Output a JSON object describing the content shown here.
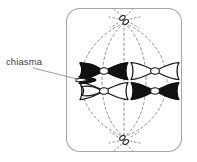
{
  "figure": {
    "kind": "biology-diagram",
    "title": "",
    "background_color": "#ffffff"
  },
  "annotations": [
    {
      "id": "chiasma",
      "label": "chiasma",
      "text_color": "#3d3d3d",
      "leader_line_color": "#8a8a8a",
      "text_x": 6,
      "text_y": 65,
      "leader_from_x": 33,
      "leader_from_y": 68,
      "leader_to_x": 79,
      "leader_to_y": 79
    }
  ],
  "cell": {
    "name": "cell-membrane",
    "shape": "rounded-rectangle",
    "x": 66,
    "y": 8,
    "width": 115,
    "height": 143,
    "corner_radius": 13,
    "stroke_color": "#a8a8a8",
    "stroke_width": 1.1,
    "fill": "none"
  },
  "poles": [
    {
      "name": "centrosome-top",
      "cx": 124,
      "cy": 20,
      "color": "#4a4a4a",
      "aster_ray_count": 6
    },
    {
      "name": "centrosome-bottom",
      "cx": 124,
      "cy": 140,
      "color": "#4a4a4a",
      "aster_ray_count": 6
    }
  ],
  "spindle": {
    "name": "spindle-fibers",
    "stroke_color": "#7d7d7d",
    "stroke_width": 0.8,
    "dash_pattern": "2.5,2.5",
    "fiber_count": 5,
    "top_pole_x": 124,
    "top_pole_y": 23,
    "bottom_pole_x": 124,
    "bottom_pole_y": 137,
    "equator_y": 81,
    "equator_x_positions": [
      80,
      102,
      124,
      146,
      167
    ]
  },
  "metaphase_plate": {
    "name": "metaphase-plate",
    "y": 81,
    "description": "two bivalents aligned at the cell equator"
  },
  "bivalents": [
    {
      "name": "bivalent-left",
      "has_chiasma": true,
      "chiasma_x": 80,
      "chiasma_y": 79,
      "chromosomes": [
        {
          "name": "chromosome-left-upper",
          "shade": "black",
          "fill": "#111111",
          "stroke": "#111111",
          "center_x": 104,
          "center_y": 71,
          "centromere_fill": "#ffffff"
        },
        {
          "name": "chromosome-left-lower",
          "shade": "white",
          "fill": "#ffffff",
          "stroke": "#111111",
          "center_x": 104,
          "center_y": 91,
          "centromere_fill": "#ffffff"
        }
      ]
    },
    {
      "name": "bivalent-right",
      "has_chiasma": false,
      "chromosomes": [
        {
          "name": "chromosome-right-upper",
          "shade": "white",
          "fill": "#ffffff",
          "stroke": "#111111",
          "center_x": 155,
          "center_y": 71,
          "centromere_fill": "#ffffff"
        },
        {
          "name": "chromosome-right-lower",
          "shade": "black",
          "fill": "#111111",
          "stroke": "#111111",
          "center_x": 155,
          "center_y": 91,
          "centromere_fill": "#ffffff"
        }
      ]
    }
  ],
  "legend": {
    "present": false,
    "items": []
  }
}
